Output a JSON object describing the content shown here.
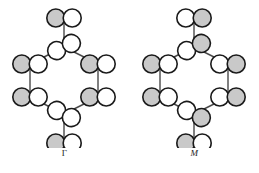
{
  "figure": {
    "title": "",
    "background": "#ffffff",
    "width": 259,
    "height": 173,
    "colors": {
      "outline": "#1a1a1a",
      "lobe_filled": "#c9c9c9",
      "lobe_empty": "#ffffff",
      "bond": "#4a4a4a"
    }
  },
  "panels": [
    {
      "id": "gamma",
      "label": "Γ",
      "label_style": "upright",
      "description": "Hexagonal ring of p-orbital lobe pairs with two axial substituent orbitals, all-in-phase pattern",
      "ring": {
        "sides": 6,
        "center_x": 64,
        "center_y": 80,
        "radius": 33
      },
      "vertices": [
        {
          "name": "top",
          "x": 64,
          "y": 47,
          "orientation": "bowtie",
          "left_lobe": "empty",
          "right_lobe": "empty"
        },
        {
          "name": "upper-left",
          "x": 30,
          "y": 64,
          "orientation": "horizontal",
          "left_lobe": "filled",
          "right_lobe": "empty"
        },
        {
          "name": "lower-left",
          "x": 30,
          "y": 97,
          "orientation": "horizontal",
          "left_lobe": "filled",
          "right_lobe": "empty"
        },
        {
          "name": "bottom",
          "x": 64,
          "y": 114,
          "orientation": "bowtie",
          "left_lobe": "empty",
          "right_lobe": "empty"
        },
        {
          "name": "lower-right",
          "x": 98,
          "y": 97,
          "orientation": "horizontal",
          "left_lobe": "filled",
          "right_lobe": "empty"
        },
        {
          "name": "upper-right",
          "x": 98,
          "y": 64,
          "orientation": "horizontal",
          "left_lobe": "filled",
          "right_lobe": "empty"
        }
      ],
      "axial": [
        {
          "name": "top-axial",
          "x": 64,
          "y": 18,
          "left_lobe": "filled",
          "right_lobe": "empty"
        },
        {
          "name": "bottom-axial",
          "x": 64,
          "y": 143,
          "left_lobe": "filled",
          "right_lobe": "empty"
        }
      ]
    },
    {
      "id": "m",
      "label": "M",
      "label_style": "italic",
      "description": "Hexagonal ring of p-orbital lobe pairs with two axial substituent orbitals, alternating-phase pattern",
      "ring": {
        "sides": 6,
        "center_x": 64,
        "center_y": 80,
        "radius": 33
      },
      "vertices": [
        {
          "name": "top",
          "x": 64,
          "y": 47,
          "orientation": "bowtie",
          "left_lobe": "empty",
          "right_lobe": "filled"
        },
        {
          "name": "upper-left",
          "x": 30,
          "y": 64,
          "orientation": "horizontal",
          "left_lobe": "filled",
          "right_lobe": "empty"
        },
        {
          "name": "lower-left",
          "x": 30,
          "y": 97,
          "orientation": "horizontal",
          "left_lobe": "filled",
          "right_lobe": "empty"
        },
        {
          "name": "bottom",
          "x": 64,
          "y": 114,
          "orientation": "bowtie",
          "left_lobe": "empty",
          "right_lobe": "filled"
        },
        {
          "name": "lower-right",
          "x": 98,
          "y": 97,
          "orientation": "horizontal",
          "left_lobe": "empty",
          "right_lobe": "filled"
        },
        {
          "name": "upper-right",
          "x": 98,
          "y": 64,
          "orientation": "horizontal",
          "left_lobe": "empty",
          "right_lobe": "filled"
        }
      ],
      "axial": [
        {
          "name": "top-axial",
          "x": 64,
          "y": 18,
          "left_lobe": "empty",
          "right_lobe": "filled"
        },
        {
          "name": "bottom-axial",
          "x": 64,
          "y": 143,
          "left_lobe": "filled",
          "right_lobe": "empty"
        }
      ]
    }
  ]
}
